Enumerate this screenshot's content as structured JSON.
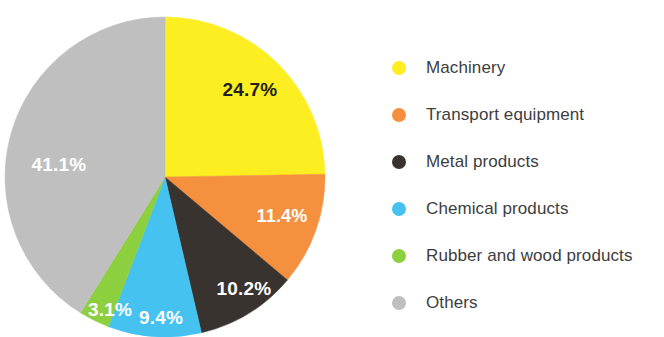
{
  "chart_data": {
    "type": "pie",
    "title": "",
    "subtitle": "",
    "xlabel": "",
    "ylabel": "",
    "legend_position": "right",
    "grid": false,
    "unit": "%",
    "categories": [
      "Machinery",
      "Transport equipment",
      "Metal products",
      "Chemical products",
      "Rubber and wood products",
      "Others"
    ],
    "values": [
      24.7,
      11.4,
      10.2,
      9.4,
      3.1,
      41.1
    ],
    "labels": [
      "24.7%",
      "11.4%",
      "10.2%",
      "9.4%",
      "3.1%",
      "41.1%"
    ],
    "colors": [
      "#FCEE21",
      "#F5913E",
      "#393330",
      "#45C2F0",
      "#8DD03F",
      "#BFBFBF"
    ],
    "label_colors": [
      "#231f20",
      "#ffffff",
      "#ffffff",
      "#ffffff",
      "#ffffff",
      "#ffffff"
    ],
    "slices": [
      {
        "name": "Machinery",
        "value": 24.7,
        "label": "24.7%",
        "color": "#FCEE21",
        "label_color": "#231f20",
        "label_x": 250,
        "label_y": 90,
        "label_size": 19
      },
      {
        "name": "Transport equipment",
        "value": 11.4,
        "label": "11.4%",
        "color": "#F5913E",
        "label_color": "#ffffff",
        "label_x": 282,
        "label_y": 216,
        "label_size": 18
      },
      {
        "name": "Metal products",
        "value": 10.2,
        "label": "10.2%",
        "color": "#393330",
        "label_color": "#ffffff",
        "label_x": 244,
        "label_y": 289,
        "label_size": 19
      },
      {
        "name": "Chemical products",
        "value": 9.4,
        "label": "9.4%",
        "color": "#45C2F0",
        "label_color": "#ffffff",
        "label_x": 161,
        "label_y": 318,
        "label_size": 19
      },
      {
        "name": "Rubber and wood products",
        "value": 3.1,
        "label": "3.1%",
        "color": "#8DD03F",
        "label_color": "#ffffff",
        "label_x": 110,
        "label_y": 310,
        "label_size": 19
      },
      {
        "name": "Others",
        "value": 41.1,
        "label": "41.1%",
        "color": "#BFBFBF",
        "label_color": "#ffffff",
        "label_x": 59,
        "label_y": 165,
        "label_size": 19
      }
    ],
    "geometry": {
      "center_x": 165,
      "center_y": 177,
      "radius": 160,
      "start_angle_deg": 0,
      "direction": "clockwise"
    }
  },
  "legend": {
    "items": [
      {
        "label": "Machinery",
        "color": "#FCEE21"
      },
      {
        "label": "Transport equipment",
        "color": "#F5913E"
      },
      {
        "label": "Metal products",
        "color": "#393330"
      },
      {
        "label": "Chemical products",
        "color": "#45C2F0"
      },
      {
        "label": "Rubber and wood products",
        "color": "#8DD03F"
      },
      {
        "label": "Others",
        "color": "#BFBFBF"
      }
    ]
  }
}
